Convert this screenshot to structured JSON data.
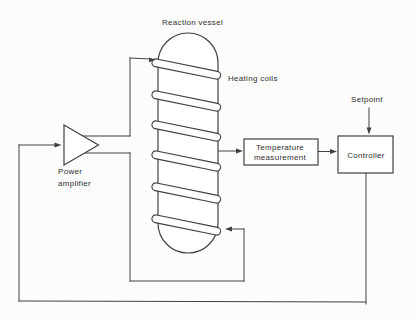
{
  "diagram": {
    "labels": {
      "reaction_vessel": "Reaction vessel",
      "heating_coils": "Heating coils",
      "setpoint": "Setpoint",
      "power_amplifier_line1": "Power",
      "power_amplifier_line2": "amplifier",
      "temperature_measurement_line1": "Temperature",
      "temperature_measurement_line2": "measurement",
      "controller": "Controller"
    },
    "colors": {
      "line": "#404040",
      "text": "#2f2f2f",
      "shape_fill": "#ffffff",
      "background": "#fcfcfc"
    }
  }
}
